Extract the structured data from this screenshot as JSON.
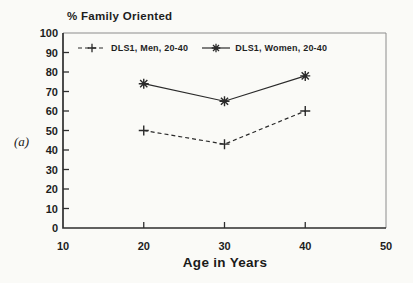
{
  "panel_label": "(a)",
  "chart_data": {
    "type": "line",
    "title": "% Family Oriented",
    "xlabel": "Age in Years",
    "ylabel": "",
    "x": [
      20,
      30,
      40
    ],
    "series": [
      {
        "name": "DLS1, Men, 20-40",
        "values": [
          50,
          43,
          60
        ],
        "marker": "plus",
        "line_style": "dashed"
      },
      {
        "name": "DLS1, Women, 20-40",
        "values": [
          74,
          65,
          78
        ],
        "marker": "asterisk",
        "line_style": "solid"
      }
    ],
    "xlim": [
      10,
      50
    ],
    "ylim": [
      0,
      100
    ],
    "x_ticks": [
      10,
      20,
      30,
      40,
      50
    ],
    "y_ticks": [
      0,
      10,
      20,
      30,
      40,
      50,
      60,
      70,
      80,
      90,
      100
    ],
    "grid": false,
    "legend_position": "top-inside",
    "colors": {
      "ink": "#1d1d1d",
      "axis": "#2e2e2e",
      "frame": "#8c8c8c",
      "series": "#2a2a2a",
      "background": "#fafaf7"
    }
  }
}
